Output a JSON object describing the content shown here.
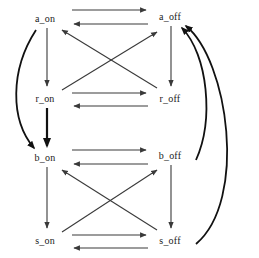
{
  "diagram": {
    "type": "state-transition-diagram",
    "title": "",
    "background_color": "#ffffff",
    "edge_color": "#3a3a3a",
    "edge_color_strong": "#111111",
    "label_color": "#1a1a1a",
    "nodes": [
      {
        "id": "a_on",
        "label": "a_on",
        "x": 45,
        "y": 18
      },
      {
        "id": "a_off",
        "label": "a_off",
        "x": 170,
        "y": 16
      },
      {
        "id": "r_on",
        "label": "r_on",
        "x": 45,
        "y": 98
      },
      {
        "id": "r_off",
        "label": "r_off",
        "x": 170,
        "y": 98
      },
      {
        "id": "b_on",
        "label": "b_on",
        "x": 45,
        "y": 157
      },
      {
        "id": "b_off",
        "label": "b_off",
        "x": 170,
        "y": 155
      },
      {
        "id": "s_on",
        "label": "s_on",
        "x": 45,
        "y": 240
      },
      {
        "id": "s_off",
        "label": "s_off",
        "x": 170,
        "y": 240
      }
    ],
    "edges": [
      {
        "from": "a_on",
        "to": "a_off",
        "style": "straight",
        "weight": "normal"
      },
      {
        "from": "a_off",
        "to": "a_on",
        "style": "straight",
        "weight": "normal"
      },
      {
        "from": "r_on",
        "to": "r_off",
        "style": "straight",
        "weight": "normal"
      },
      {
        "from": "r_off",
        "to": "r_on",
        "style": "straight",
        "weight": "normal"
      },
      {
        "from": "b_on",
        "to": "b_off",
        "style": "straight",
        "weight": "normal"
      },
      {
        "from": "b_off",
        "to": "b_on",
        "style": "straight",
        "weight": "normal"
      },
      {
        "from": "s_on",
        "to": "s_off",
        "style": "straight",
        "weight": "normal"
      },
      {
        "from": "s_off",
        "to": "s_on",
        "style": "straight",
        "weight": "normal"
      },
      {
        "from": "a_on",
        "to": "r_on",
        "style": "straight",
        "weight": "normal"
      },
      {
        "from": "r_on",
        "to": "b_on",
        "style": "straight",
        "weight": "bold"
      },
      {
        "from": "b_on",
        "to": "s_on",
        "style": "straight",
        "weight": "normal"
      },
      {
        "from": "a_off",
        "to": "r_off",
        "style": "straight",
        "weight": "normal"
      },
      {
        "from": "b_off",
        "to": "s_off",
        "style": "straight",
        "weight": "normal"
      },
      {
        "from": "r_on",
        "to": "a_off",
        "style": "diagonal",
        "weight": "normal"
      },
      {
        "from": "r_off",
        "to": "a_on",
        "style": "diagonal",
        "weight": "normal"
      },
      {
        "from": "s_on",
        "to": "b_off",
        "style": "diagonal",
        "weight": "normal"
      },
      {
        "from": "s_off",
        "to": "b_on",
        "style": "diagonal",
        "weight": "normal"
      },
      {
        "from": "a_on",
        "to": "b_on",
        "style": "curve-left",
        "weight": "bold"
      },
      {
        "from": "b_off",
        "to": "a_off",
        "style": "curve-right",
        "weight": "bold"
      },
      {
        "from": "s_off",
        "to": "a_off",
        "style": "curve-right",
        "weight": "bold"
      }
    ]
  }
}
